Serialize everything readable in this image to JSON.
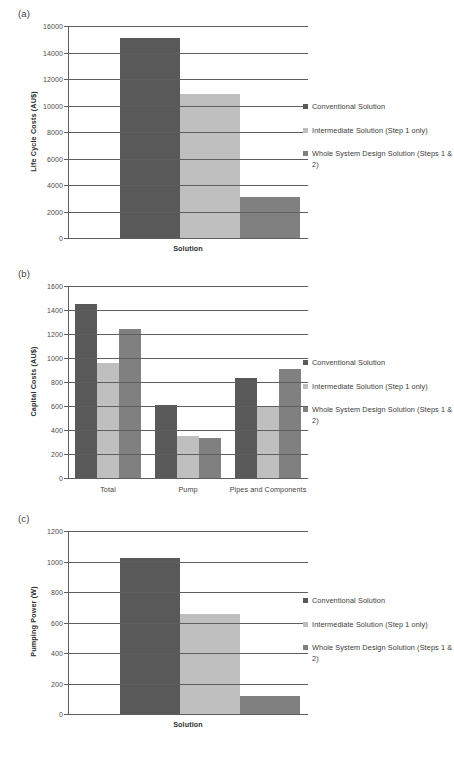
{
  "figure": {
    "background": "#ffffff",
    "series_colors": {
      "conventional": "#595959",
      "intermediate": "#bfbfbf",
      "whole_system": "#808080"
    },
    "legend_labels": [
      "Conventional Solution",
      "Intermediate Solution (Step 1 only)",
      "Whole System Design Solution (Steps 1 & 2)"
    ]
  },
  "panels": [
    {
      "tag": "(a)",
      "ylabel": "Life Cycle Costs (AU$)",
      "xlabel": "Solution"
    },
    {
      "tag": "(b)",
      "ylabel": "Capital Costs (AU$)",
      "xlabel": ""
    },
    {
      "tag": "(c)",
      "ylabel": "Pumping Power (W)",
      "xlabel": "Solution"
    }
  ],
  "chart_data": [
    {
      "type": "bar",
      "panel": "(a)",
      "title": "",
      "xlabel": "Solution",
      "ylabel": "Life Cycle Costs (AU$)",
      "categories": [
        "Solution"
      ],
      "ylim": [
        0,
        16000
      ],
      "yticks": [
        0,
        2000,
        4000,
        6000,
        8000,
        10000,
        12000,
        14000,
        16000
      ],
      "ytick_labels": [
        "0",
        "2000",
        "4000",
        "6000",
        "8000",
        "10000",
        "12000",
        "14000",
        "16000"
      ],
      "grid": true,
      "legend_position": "right",
      "series": [
        {
          "name": "Conventional Solution",
          "color": "#595959",
          "values": [
            15100
          ]
        },
        {
          "name": "Intermediate Solution (Step 1 only)",
          "color": "#bfbfbf",
          "values": [
            10850
          ]
        },
        {
          "name": "Whole System Design Solution (Steps 1 & 2)",
          "color": "#808080",
          "values": [
            3100
          ]
        }
      ]
    },
    {
      "type": "bar",
      "panel": "(b)",
      "title": "",
      "xlabel": "",
      "ylabel": "Capital Costs (AU$)",
      "categories": [
        "Total",
        "Pump",
        "Pipes and Components"
      ],
      "ylim": [
        0,
        1600
      ],
      "yticks": [
        0,
        200,
        400,
        600,
        800,
        1000,
        1200,
        1400,
        1600
      ],
      "ytick_labels": [
        "0",
        "200",
        "400",
        "600",
        "800",
        "1000",
        "1200",
        "1400",
        "1600"
      ],
      "grid": true,
      "legend_position": "right",
      "series": [
        {
          "name": "Conventional Solution",
          "color": "#595959",
          "values": [
            1452,
            612,
            835
          ]
        },
        {
          "name": "Intermediate Solution (Step 1 only)",
          "color": "#bfbfbf",
          "values": [
            962,
            352,
            595
          ]
        },
        {
          "name": "Whole System Design Solution (Steps 1 & 2)",
          "color": "#808080",
          "values": [
            1242,
            330,
            912
          ]
        }
      ]
    },
    {
      "type": "bar",
      "panel": "(c)",
      "title": "",
      "xlabel": "Solution",
      "ylabel": "Pumping Power (W)",
      "categories": [
        "Solution"
      ],
      "ylim": [
        0,
        1200
      ],
      "yticks": [
        0,
        200,
        400,
        600,
        800,
        1000,
        1200
      ],
      "ytick_labels": [
        "0",
        "200",
        "400",
        "600",
        "800",
        "1000",
        "1200"
      ],
      "grid": true,
      "legend_position": "right",
      "series": [
        {
          "name": "Conventional Solution",
          "color": "#595959",
          "values": [
            1022
          ]
        },
        {
          "name": "Intermediate Solution (Step 1 only)",
          "color": "#bfbfbf",
          "values": [
            655
          ]
        },
        {
          "name": "Whole System Design Solution (Steps 1 & 2)",
          "color": "#808080",
          "values": [
            118
          ]
        }
      ]
    }
  ]
}
